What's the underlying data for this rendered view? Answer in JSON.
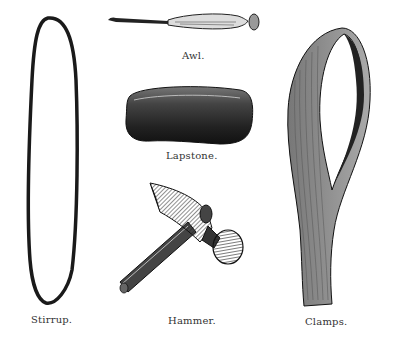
{
  "figure": {
    "items": [
      {
        "id": "stirrup",
        "label": "Stirrup."
      },
      {
        "id": "awl",
        "label": "Awl."
      },
      {
        "id": "lapstone",
        "label": "Lapstone."
      },
      {
        "id": "hammer",
        "label": "Hammer."
      },
      {
        "id": "clamps",
        "label": "Clamps."
      }
    ]
  },
  "colors": {
    "ink": "#1a1a1a",
    "paper": "#ffffff"
  }
}
